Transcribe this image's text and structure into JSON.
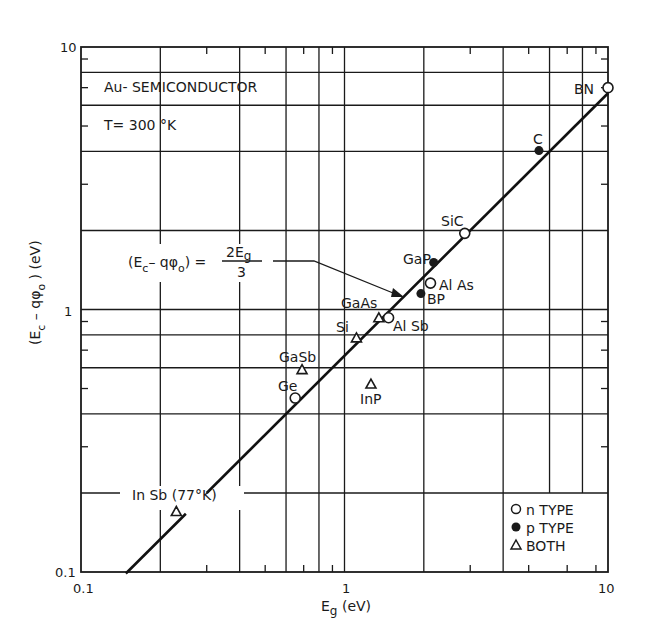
{
  "chart_data": {
    "type": "scatter",
    "subtitle": "T= 300 °K",
    "xlabel": "E_g (eV)",
    "ylabel": "(E_c − qφ_o) (eV)",
    "xscale": "log",
    "yscale": "log",
    "xlim": [
      0.1,
      10
    ],
    "ylim": [
      0.1,
      10
    ],
    "x_tick_labels": [
      "0.1",
      "1",
      "10"
    ],
    "y_tick_labels": [
      "0.1",
      "1",
      "10"
    ],
    "x_gridlines": [
      0.2,
      0.4,
      0.6,
      0.8,
      1,
      2,
      4,
      6,
      8
    ],
    "x_minor_ticks": [
      0.3,
      0.5,
      0.7,
      0.9,
      3,
      5,
      7,
      9
    ],
    "y_gridlines": [
      0.2,
      0.4,
      0.6,
      0.8,
      1,
      2,
      4,
      6,
      8
    ],
    "y_minor_ticks": [
      0.3,
      0.5,
      0.7,
      0.9,
      3,
      5,
      7,
      9
    ],
    "grid": true,
    "fit_line": {
      "equation": "(E_c − qφ_o) = 2E_g/3",
      "slope": 0.6667,
      "x_range": [
        0.148,
        10
      ]
    },
    "series": [
      {
        "name": "n TYPE",
        "marker": "open-circle",
        "points": [
          {
            "label": "BN",
            "x": 10.0,
            "y": 7.0
          },
          {
            "label": "SiC",
            "x": 2.86,
            "y": 1.95
          },
          {
            "label": "AlAs",
            "x": 2.12,
            "y": 1.26
          },
          {
            "label": "AlSb",
            "x": 1.47,
            "y": 0.93
          },
          {
            "label": "Ge",
            "x": 0.65,
            "y": 0.46
          }
        ]
      },
      {
        "name": "p TYPE",
        "marker": "filled-circle",
        "points": [
          {
            "label": "C",
            "x": 5.47,
            "y": 4.03
          },
          {
            "label": "GaP",
            "x": 2.18,
            "y": 1.51
          },
          {
            "label": "BP",
            "x": 1.95,
            "y": 1.15
          }
        ]
      },
      {
        "name": "BOTH",
        "marker": "open-triangle",
        "points": [
          {
            "label": "GaAs",
            "x": 1.35,
            "y": 0.93
          },
          {
            "label": "Si",
            "x": 1.11,
            "y": 0.78
          },
          {
            "label": "GaSb",
            "x": 0.69,
            "y": 0.59
          },
          {
            "label": "InP",
            "x": 1.26,
            "y": 0.52
          },
          {
            "label": "In Sb (77°K)",
            "x": 0.23,
            "y": 0.17
          }
        ]
      }
    ],
    "legend": {
      "position": "lower right",
      "entries": [
        {
          "marker": "open-circle",
          "label": "n TYPE"
        },
        {
          "marker": "filled-circle",
          "label": "p TYPE"
        },
        {
          "marker": "open-triangle",
          "label": "BOTH"
        }
      ]
    }
  },
  "annotations": {
    "title": "Au- SEMICONDUCTOR",
    "temperature": "T= 300 °K",
    "formula_left": "(E",
    "formula_sub_c": "c",
    "formula_mid": "– qφ",
    "formula_sub_o": "o",
    "formula_right": ") =",
    "formula_num": "2E",
    "formula_num_sub": "g",
    "formula_den": "3"
  },
  "axes": {
    "x_label_main": "E",
    "x_label_sub": "g",
    "x_label_unit": " (eV)",
    "y_label": "(E",
    "y_label_sub_c": "c",
    "y_label_mid": " – qφ",
    "y_label_sub_o": "o",
    "y_label_end": " ) (eV)",
    "x_ticks": [
      {
        "label": "0.1",
        "value": 0.1
      },
      {
        "label": "1",
        "value": 1
      },
      {
        "label": "10",
        "value": 10
      }
    ],
    "y_ticks": [
      {
        "label": "0.1",
        "value": 0.1
      },
      {
        "label": "1",
        "value": 1
      },
      {
        "label": "10",
        "value": 10
      }
    ]
  },
  "point_labels": [
    {
      "text": "BN",
      "x": 574,
      "y": 94
    },
    {
      "text": "C",
      "x": 533,
      "y": 144
    },
    {
      "text": "SiC",
      "x": 441,
      "y": 226
    },
    {
      "text": "GaP",
      "x": 403,
      "y": 264
    },
    {
      "text": "Al As",
      "x": 439,
      "y": 290
    },
    {
      "text": "BP",
      "x": 427,
      "y": 304
    },
    {
      "text": "GaAs",
      "x": 341,
      "y": 308
    },
    {
      "text": "Al Sb",
      "x": 393,
      "y": 331
    },
    {
      "text": "Si",
      "x": 336,
      "y": 332
    },
    {
      "text": "GaSb",
      "x": 279,
      "y": 362
    },
    {
      "text": "Ge",
      "x": 278,
      "y": 391
    },
    {
      "text": "InP",
      "x": 360,
      "y": 404
    },
    {
      "text": "In Sb (77°K)",
      "x": 132,
      "y": 500
    }
  ],
  "legend_labels": [
    "n TYPE",
    "p TYPE",
    "BOTH"
  ]
}
